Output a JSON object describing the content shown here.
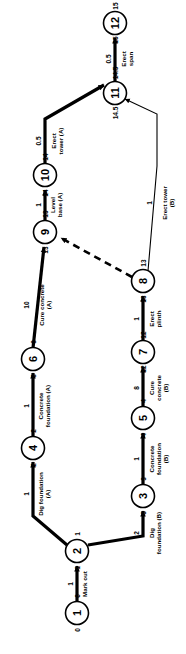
{
  "diagram": {
    "type": "activity-on-arrow-network",
    "orientation_note": "rotated-90-ccw",
    "title": "",
    "nodes": [
      {
        "id": "1",
        "label": "1",
        "early": "0",
        "late": "0",
        "cx": 77,
        "cy": 613
      },
      {
        "id": "2",
        "label": "2",
        "early": "1",
        "late": "1",
        "cx": 77,
        "cy": 551
      },
      {
        "id": "3",
        "label": "3",
        "early": "3",
        "late": "3",
        "cx": 143,
        "cy": 496
      },
      {
        "id": "4",
        "label": "4",
        "early": "2",
        "late": "2",
        "cx": 33,
        "cy": 448
      },
      {
        "id": "5",
        "label": "5",
        "early": "4",
        "late": "4",
        "cx": 143,
        "cy": 418
      },
      {
        "id": "6",
        "label": "6",
        "early": "3",
        "late": "3",
        "cx": 33,
        "cy": 359
      },
      {
        "id": "7",
        "label": "7",
        "early": "12",
        "late": "12",
        "cx": 143,
        "cy": 352
      },
      {
        "id": "8",
        "label": "8",
        "early": "13",
        "late": "13",
        "cx": 143,
        "cy": 281
      },
      {
        "id": "9",
        "label": "9",
        "early": "13",
        "late": "13",
        "cx": 45,
        "cy": 232
      },
      {
        "id": "10",
        "label": "10",
        "early": "14",
        "late": "14",
        "cx": 45,
        "cy": 175
      },
      {
        "id": "11",
        "label": "11",
        "early": "14.5",
        "late": "14.5",
        "cx": 115,
        "cy": 93
      },
      {
        "id": "12",
        "label": "12",
        "early": "15",
        "late": "15",
        "cx": 115,
        "cy": 23
      }
    ],
    "activities": [
      {
        "from": "1",
        "to": "2",
        "name": "Mark out",
        "duration": "1",
        "style": "critical"
      },
      {
        "from": "2",
        "to": "4",
        "name": "Dig foundation\n(A)",
        "duration": "1",
        "style": "critical"
      },
      {
        "from": "4",
        "to": "6",
        "name": "Concrete\nfoundation (A)",
        "duration": "1",
        "style": "critical"
      },
      {
        "from": "6",
        "to": "9",
        "name": "Cure concrete\n(A)",
        "duration": "10",
        "style": "critical"
      },
      {
        "from": "9",
        "to": "10",
        "name": "Level\nbase (A)",
        "duration": "1",
        "style": "critical"
      },
      {
        "from": "10",
        "to": "11",
        "name": "Erect\ntower (A)",
        "duration": "0.5",
        "style": "critical"
      },
      {
        "from": "11",
        "to": "12",
        "name": "Erect\nspan",
        "duration": "0.5",
        "style": "critical"
      },
      {
        "from": "2",
        "to": "3",
        "name": "Dig\nfoundation (B)",
        "duration": "2",
        "style": "critical"
      },
      {
        "from": "3",
        "to": "5",
        "name": "Concrete\nfoundation\n(B)",
        "duration": "1",
        "style": "critical"
      },
      {
        "from": "5",
        "to": "7",
        "name": "Cure\nconcrete\n(B)",
        "duration": "8",
        "style": "critical"
      },
      {
        "from": "7",
        "to": "8",
        "name": "Erect\nplinth",
        "duration": "1",
        "style": "critical"
      },
      {
        "from": "8",
        "to": "11",
        "name": "Erect tower\n(B)",
        "duration": "1",
        "style": "normal"
      },
      {
        "from": "8",
        "to": "9",
        "name": "",
        "duration": "",
        "style": "dummy"
      }
    ],
    "labels": {
      "mark_out": "Mark out",
      "dig_foundation_a": "Dig foundation",
      "dig_foundation_a2": "(A)",
      "concrete_foundation_a": "Concrete",
      "concrete_foundation_a2": "foundation (A)",
      "cure_concrete_a": "Cure concrete",
      "cure_concrete_a2": "(A)",
      "level_base_a": "Level",
      "level_base_a2": "base (A)",
      "erect_tower_a": "Erect",
      "erect_tower_a2": "tower (A)",
      "erect_span": "Erect",
      "erect_span2": "span",
      "dig_foundation_b": "Dig",
      "dig_foundation_b2": "foundation (B)",
      "concrete_foundation_b": "Concrete",
      "concrete_foundation_b2": "foundation",
      "concrete_foundation_b3": "(B)",
      "cure_concrete_b": "Cure",
      "cure_concrete_b2": "concrete",
      "cure_concrete_b3": "(B)",
      "erect_plinth": "Erect",
      "erect_plinth2": "plinth",
      "erect_tower_b": "Erect tower",
      "erect_tower_b2": "(B)"
    },
    "durations": {
      "mark_out": "1",
      "dig_a": "1",
      "conc_a": "1",
      "cure_a": "10",
      "level_a": "1",
      "tower_a": "0.5",
      "span": "0.5",
      "dig_b": "2",
      "conc_b": "1",
      "cure_b": "8",
      "plinth": "1",
      "tower_b": "1"
    },
    "colors": {
      "ink": "#000000",
      "paper": "#ffffff"
    }
  }
}
